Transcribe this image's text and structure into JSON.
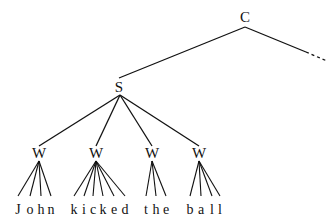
{
  "diagram": {
    "type": "tree",
    "colors": {
      "ink": "#111111",
      "background": "#ffffff"
    },
    "root": {
      "label": "C",
      "x": 245,
      "y": 22
    },
    "continuation": {
      "description": "dashed edge to omitted sibling",
      "from": [
        245,
        27
      ],
      "solid_to": [
        306,
        52
      ],
      "dashed_to": [
        327,
        61
      ]
    },
    "s_node": {
      "label": "S",
      "x": 119,
      "y": 92
    },
    "words": [
      {
        "node_label": "W",
        "x": 39,
        "y": 158,
        "text": "John",
        "letters": [
          "J",
          "o",
          "h",
          "n"
        ],
        "letter_x": [
          18,
          30,
          41,
          51
        ]
      },
      {
        "node_label": "W",
        "x": 96,
        "y": 158,
        "text": "kicked",
        "letters": [
          "k",
          "i",
          "c",
          "k",
          "e",
          "d"
        ],
        "letter_x": [
          74,
          84,
          93,
          103,
          114,
          125
        ]
      },
      {
        "node_label": "W",
        "x": 152,
        "y": 158,
        "text": "the",
        "letters": [
          "t",
          "h",
          "e"
        ],
        "letter_x": [
          146,
          156,
          166
        ]
      },
      {
        "node_label": "W",
        "x": 199,
        "y": 158,
        "text": "ball",
        "letters": [
          "b",
          "a",
          "l",
          "l"
        ],
        "letter_x": [
          190,
          201,
          212,
          220
        ]
      }
    ]
  }
}
